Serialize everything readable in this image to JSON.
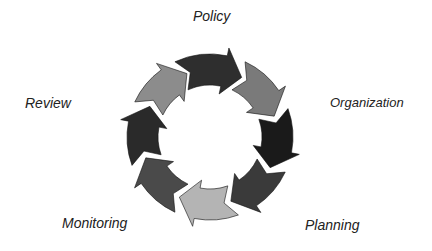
{
  "diagram": {
    "type": "cycle",
    "direction": "clockwise",
    "center": [
      210,
      137
    ],
    "outer_radius": 83,
    "inner_radius": 52,
    "segments": [
      {
        "start_deg": -115,
        "end_deg": -62,
        "color": "#2e2e2e"
      },
      {
        "start_deg": -65,
        "end_deg": -18,
        "color": "#7a7a7a"
      },
      {
        "start_deg": -20,
        "end_deg": 27,
        "color": "#1a1a1a"
      },
      {
        "start_deg": 25,
        "end_deg": 72,
        "color": "#3a3a3a"
      },
      {
        "start_deg": 70,
        "end_deg": 117,
        "color": "#b4b4b4"
      },
      {
        "start_deg": 115,
        "end_deg": 162,
        "color": "#4a4a4a"
      },
      {
        "start_deg": 160,
        "end_deg": 207,
        "color": "#2a2a2a"
      },
      {
        "start_deg": 205,
        "end_deg": 250,
        "color": "#8c8c8c"
      }
    ],
    "labels": [
      {
        "text": "Policy",
        "x": 193,
        "y": 8
      },
      {
        "text": "Organization",
        "x": 330,
        "y": 95
      },
      {
        "text": "Planning",
        "x": 305,
        "y": 217
      },
      {
        "text": "Monitoring",
        "x": 62,
        "y": 215
      },
      {
        "text": "Review",
        "x": 25,
        "y": 95
      }
    ]
  }
}
